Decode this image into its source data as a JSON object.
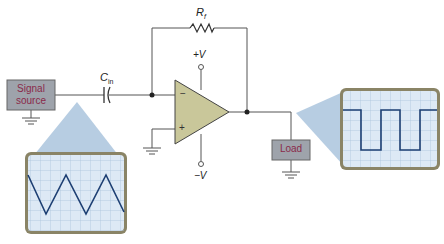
{
  "diagram": {
    "colors": {
      "wire": "#555555",
      "opamp_fill": "#c9c79a",
      "box_fill": "#9ea3ab",
      "box_text": "#8a2a4a",
      "scope_frame": "#8a8466",
      "scope_screen": "#dde9f5",
      "scope_grid": "#a9c3dc",
      "trace": "#1d3f73",
      "projection": "#9fbcd8"
    },
    "labels": {
      "signal_source": [
        "Signal",
        "source"
      ],
      "capacitor": "C",
      "capacitor_sub": "in",
      "resistor": "R",
      "resistor_sub": "f",
      "plus_v": "+V",
      "minus_v": "−V",
      "inverting_input": "−",
      "noninverting_input": "+",
      "load": "Load"
    },
    "input_scope": {
      "waveform": "triangle",
      "grid_cols": 10,
      "grid_rows": 8
    },
    "output_scope": {
      "waveform": "square",
      "grid_cols": 10,
      "grid_rows": 8
    }
  }
}
